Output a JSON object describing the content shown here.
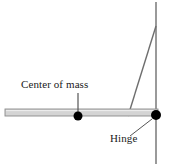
{
  "figure": {
    "background_color": "#ffffff",
    "width": 169,
    "height": 166,
    "labels": {
      "center_of_mass": "Center of mass",
      "hinge": "Hinge"
    },
    "colors": {
      "bar_fill": "#d4d4d4",
      "bar_outline": "#8a8a8a",
      "wall_line": "#9a9a9a",
      "cable_line": "#6e6e6e",
      "leader_line": "#555555",
      "dot_fill": "#000000",
      "text": "#1a1a1a"
    },
    "elements": {
      "bar": {
        "name": "horizontal-bar",
        "x1": 5,
        "y1": 112,
        "x2": 158,
        "y2": 112,
        "thickness": 7
      },
      "wall": {
        "name": "vertical-wall",
        "x1": 156,
        "y1": 2,
        "x2": 156,
        "y2": 164,
        "thickness": 2
      },
      "cable": {
        "name": "diagonal-cable",
        "x1": 156,
        "y1": 26,
        "x2": 128,
        "y2": 116,
        "thickness": 1.4
      },
      "center_of_mass_dot": {
        "name": "center-of-mass-dot",
        "cx": 78,
        "cy": 116,
        "r": 4.5
      },
      "hinge_dot": {
        "name": "hinge-dot",
        "cx": 156,
        "cy": 115,
        "r": 5
      },
      "center_of_mass_leader": {
        "name": "center-of-mass-leader-line",
        "x1": 78,
        "y1": 93,
        "x2": 78,
        "y2": 114
      },
      "hinge_leader": {
        "name": "hinge-leader-line",
        "x1": 152,
        "y1": 119,
        "x2": 130,
        "y2": 136
      }
    }
  }
}
